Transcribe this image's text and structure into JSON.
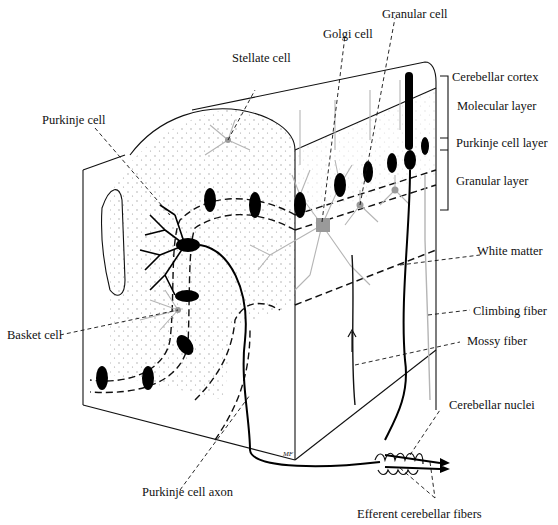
{
  "figure": {
    "signature": "MF"
  },
  "labels": {
    "stellate_cell": "Stellate cell",
    "golgi_cell": "Golgi cell",
    "granular_cell": "Granular cell",
    "purkinje_cell": "Purkinje cell",
    "cerebellar_cortex": "Cerebellar cortex",
    "molecular_layer": "Molecular layer",
    "purkinje_cell_layer": "Purkinje cell layer",
    "granular_layer": "Granular layer",
    "white_matter": "White matter",
    "basket_cell": "Basket cell",
    "climbing_fiber": "Climbing fiber",
    "mossy_fiber": "Mossy fiber",
    "cerebellar_nuclei": "Cerebellar nuclei",
    "purkinje_cell_axon": "Purkinje cell axon",
    "efferent_fibers": "Efferent cerebellar fibers"
  },
  "colors": {
    "ink": "#111111",
    "grey_cells": "#9a9a9a",
    "stipple": "#9c9c9c",
    "background": "#ffffff"
  }
}
